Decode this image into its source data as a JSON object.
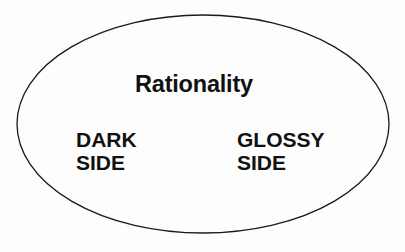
{
  "diagram": {
    "shape": "ellipse",
    "stroke_color": "#1a1a1a",
    "fill_color": "#fdfdfd",
    "title": "Rationality",
    "left_label": {
      "line1": "DARK",
      "line2": "SIDE"
    },
    "right_label": {
      "line1": "GLOSSY",
      "line2": "SIDE"
    }
  }
}
